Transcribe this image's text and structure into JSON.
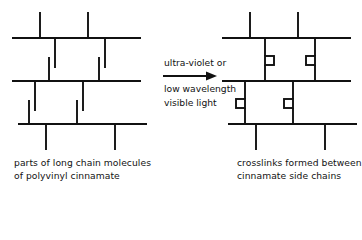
{
  "figure": {
    "background_color": "#ffffff",
    "line_color": "#111111",
    "text_color": "#121212"
  },
  "reaction": {
    "condition_line_1": "ultra-violet or",
    "condition_line_2": "low wavelength",
    "condition_line_3": "visible light",
    "arrow_direction": "right"
  },
  "left_panel": {
    "caption_line_1": "parts of long chain molecules",
    "caption_line_2": "of polyvinyl  cinnamate",
    "description": "three parallel polymer backbones with pendant cinnamate side chains drawn as pairs of parallel vertical strokes",
    "backbone_count": 3,
    "crosslink_count": 0
  },
  "right_panel": {
    "caption_line_1": "crosslinks formed between",
    "caption_line_2": "cinnamate side chains",
    "description": "same three backbones with side chains joined by small square cyclobutane crosslink rings",
    "backbone_count": 3,
    "crosslink_count": 4
  },
  "geometry": {
    "stroke_width": 1.9,
    "backbones_left": [
      {
        "y": 38,
        "x1": 12,
        "x2": 141
      },
      {
        "y": 81,
        "x1": 12,
        "x2": 141
      },
      {
        "y": 124,
        "x1": 18,
        "x2": 147
      }
    ],
    "backbones_right": [
      {
        "y": 38,
        "x1": 222,
        "x2": 351
      },
      {
        "y": 81,
        "x1": 222,
        "x2": 351
      },
      {
        "y": 124,
        "x1": 228,
        "x2": 357
      }
    ],
    "crosslink_box_size": 9
  }
}
